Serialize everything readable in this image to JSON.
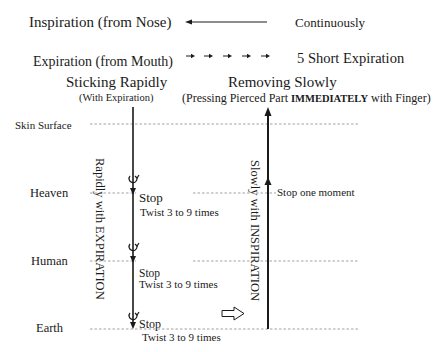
{
  "legend": {
    "inspiration": {
      "label": "Inspiration (from Nose)",
      "description": "Continuously"
    },
    "expiration": {
      "label": "Expiration (from Mouth)",
      "description": "5 Short Expiration"
    }
  },
  "left_column": {
    "title": "Sticking Rapidly",
    "subtitle": "(With Expiration)",
    "vertical_label": "Rapidly with EXPIRATION",
    "stops": [
      {
        "stop": "Stop",
        "twist": "Twist 3 to 9 times"
      },
      {
        "stop": "Stop",
        "twist": "Twist 3 to 9 times"
      },
      {
        "stop": "Stop",
        "twist": "Twist 3 to 9 times"
      }
    ]
  },
  "right_column": {
    "title": "Removing Slowly",
    "subtitle_pre": "(Pressing Pierced Part ",
    "subtitle_emph": "IMMEDIATELY",
    "subtitle_post": " with Finger)",
    "vertical_label": "Slowly with INSPIRATION",
    "stop_note": "Stop one moment"
  },
  "levels": [
    {
      "name": "Skin Surface"
    },
    {
      "name": "Heaven"
    },
    {
      "name": "Human"
    },
    {
      "name": "Earth"
    }
  ],
  "colors": {
    "ink": "#1a1a1a",
    "dash": "#8a8a8a"
  }
}
